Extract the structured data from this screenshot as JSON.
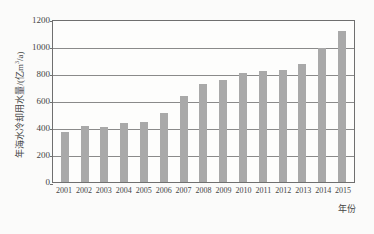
{
  "chart_data": {
    "type": "bar",
    "title": "",
    "subtitle": "",
    "xlabel": "年份",
    "ylabel": "年海水冷却用水量/(亿m³/a)",
    "ylabel_parts": {
      "prefix": "年海水冷却用水量/(亿m",
      "exponent": "3",
      "suffix": "/a)"
    },
    "categories": [
      "2001",
      "2002",
      "2003",
      "2004",
      "2005",
      "2006",
      "2007",
      "2008",
      "2009",
      "2010",
      "2011",
      "2012",
      "2013",
      "2014",
      "2015"
    ],
    "values": [
      370,
      410,
      405,
      432,
      442,
      505,
      630,
      725,
      750,
      805,
      815,
      825,
      870,
      990,
      1110
    ],
    "series": [
      {
        "name": "年海水冷却用水量",
        "values": [
          370,
          410,
          405,
          432,
          442,
          505,
          630,
          725,
          750,
          805,
          815,
          825,
          870,
          990,
          1110
        ]
      }
    ],
    "ylim": [
      0,
      1200
    ],
    "yticks": [
      0,
      200,
      400,
      600,
      800,
      1000,
      1200
    ],
    "ytick_labels": [
      "0",
      "200",
      "400",
      "600",
      "800",
      "1000",
      "1200"
    ],
    "grid": true,
    "grid_axis": "y",
    "legend": false,
    "legend_position": "none",
    "bar_color": "#a9a9a9",
    "axis_color": "#6f6f6f",
    "grid_color": "#8a8a8a",
    "background_color": "#fbfbfa",
    "text_color": "#454545"
  }
}
